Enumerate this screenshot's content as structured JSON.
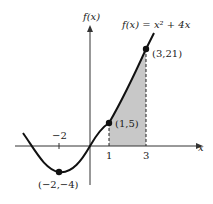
{
  "figure": {
    "y_axis_label": "f(x)",
    "x_axis_label": "x",
    "function_label": "f(x) = x² + 4x",
    "points": [
      {
        "label": "(3,21)",
        "x": 3,
        "y": 21
      },
      {
        "label": "(1,5)",
        "x": 1,
        "y": 5
      },
      {
        "label": "(−2,−4)",
        "x": -2,
        "y": -4
      }
    ],
    "x_ticks": [
      {
        "label": "−2",
        "value": -2
      },
      {
        "label": "1",
        "value": 1
      },
      {
        "label": "3",
        "value": 3
      }
    ],
    "shaded_region": {
      "from": 1,
      "to": 3
    },
    "colors": {
      "curve": "#111111",
      "shade": "#c8c8c8",
      "axis": "#333333"
    }
  }
}
